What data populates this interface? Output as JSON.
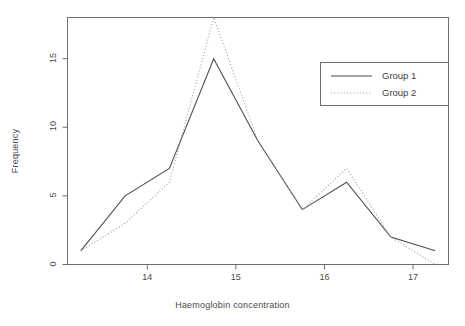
{
  "chart_data": {
    "type": "line",
    "title": "",
    "subtitle": "",
    "xlabel": "Haemoglobin concentration",
    "ylabel": "Frequency",
    "x": [
      13.25,
      13.75,
      14.25,
      14.75,
      15.25,
      15.75,
      16.25,
      16.75,
      17.25
    ],
    "xtick_labels": [
      "14",
      "15",
      "16",
      "17"
    ],
    "xtick_values": [
      14,
      15,
      16,
      17
    ],
    "ytick_labels": [
      "0",
      "5",
      "10",
      "15"
    ],
    "ytick_values": [
      0,
      5,
      10,
      15
    ],
    "xlim": [
      13.1,
      17.4
    ],
    "ylim": [
      0,
      18
    ],
    "grid": false,
    "legend_position": "top-right",
    "series": [
      {
        "name": "Group 1",
        "linestyle": "solid",
        "color": "#4d4d4d",
        "values": [
          1,
          5,
          7,
          15,
          9,
          4,
          6,
          2,
          1
        ]
      },
      {
        "name": "Group 2",
        "linestyle": "dotted",
        "color": "#9a9a9a",
        "values": [
          1,
          3,
          6,
          18,
          9,
          4,
          7,
          2,
          0
        ]
      }
    ]
  },
  "legend": {
    "items": [
      {
        "label": "Group 1",
        "style": "solid"
      },
      {
        "label": "Group 2",
        "style": "dotted"
      }
    ]
  },
  "axes": {
    "x_title": "Haemoglobin concentration",
    "y_title": "Frequency",
    "x_ticks": [
      "14",
      "15",
      "16",
      "17"
    ],
    "y_ticks": [
      "0",
      "5",
      "10",
      "15"
    ]
  },
  "colors": {
    "background": "#ffffff",
    "axis": "#6f6f6f",
    "text": "#4a4a4a",
    "series1": "#4d4d4d",
    "series2": "#9a9a9a"
  }
}
